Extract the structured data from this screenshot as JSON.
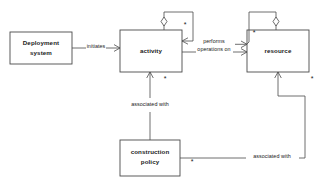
{
  "diagram": {
    "type": "uml-class-diagram",
    "title": "",
    "background_color": "#ffffff",
    "line_color": "#4a4a4a",
    "text_color": "#1a1a1a",
    "entities": [
      {
        "id": "deployment-system",
        "label_line1": "Deployment",
        "label_line2": "system",
        "x": 10,
        "y": 32,
        "width": 62,
        "height": 32
      },
      {
        "id": "activity",
        "label_line1": "activity",
        "label_line2": "",
        "x": 120,
        "y": 30,
        "width": 62,
        "height": 42
      },
      {
        "id": "resource",
        "label_line1": "resource",
        "label_line2": "",
        "x": 247,
        "y": 30,
        "width": 62,
        "height": 42
      },
      {
        "id": "construction-policy",
        "label_line1": "construction",
        "label_line2": "policy",
        "x": 120,
        "y": 140,
        "width": 60,
        "height": 36
      }
    ],
    "relationships": [
      {
        "id": "initiates",
        "label": "initiates",
        "from": "deployment-system",
        "to": "activity",
        "label_x": 96,
        "label_y": 48
      },
      {
        "id": "performs-operations-on",
        "label_line1": "performs",
        "label_line2": "operations on",
        "from": "activity",
        "to": "resource",
        "label_x": 214,
        "label_y": 45
      },
      {
        "id": "activity-self-aggregation",
        "label": "",
        "from": "activity",
        "to": "activity",
        "multiplicity": "*"
      },
      {
        "id": "resource-self-aggregation",
        "label": "",
        "from": "resource",
        "to": "resource",
        "multiplicity": "*"
      },
      {
        "id": "policy-associated-with-activity",
        "label": "associated with",
        "from": "construction-policy",
        "to": "activity",
        "label_x": 150,
        "label_y": 105
      },
      {
        "id": "policy-associated-with-resource",
        "label": "associated with",
        "from": "construction-policy",
        "to": "resource",
        "label_x": 272,
        "label_y": 158
      }
    ],
    "multiplicities": [
      {
        "id": "activity-loop-mult",
        "symbol": "*",
        "x": 185,
        "y": 25
      },
      {
        "id": "activity-bottom-mult",
        "symbol": "*",
        "x": 165,
        "y": 79
      },
      {
        "id": "resource-loop-mult",
        "symbol": "*",
        "x": 254,
        "y": 33
      },
      {
        "id": "resource-bottom-mult",
        "symbol": "*",
        "x": 312,
        "y": 79
      },
      {
        "id": "policy-right-mult",
        "symbol": "*",
        "x": 192,
        "y": 162
      }
    ]
  }
}
